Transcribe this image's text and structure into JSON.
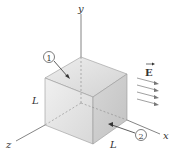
{
  "diagram": {
    "axes": {
      "y": "y",
      "x": "x",
      "z": "z"
    },
    "side_labels": {
      "left_edge": "L",
      "bottom_edge": "L"
    },
    "face_markers": {
      "top": "1",
      "right": "2"
    },
    "field": {
      "label": "E",
      "arrow_count": 4
    },
    "colors": {
      "face_top": "#dcdcdc",
      "face_front": "#e3e3e3",
      "face_right": "#cfcfcf",
      "line": "#666666"
    }
  }
}
